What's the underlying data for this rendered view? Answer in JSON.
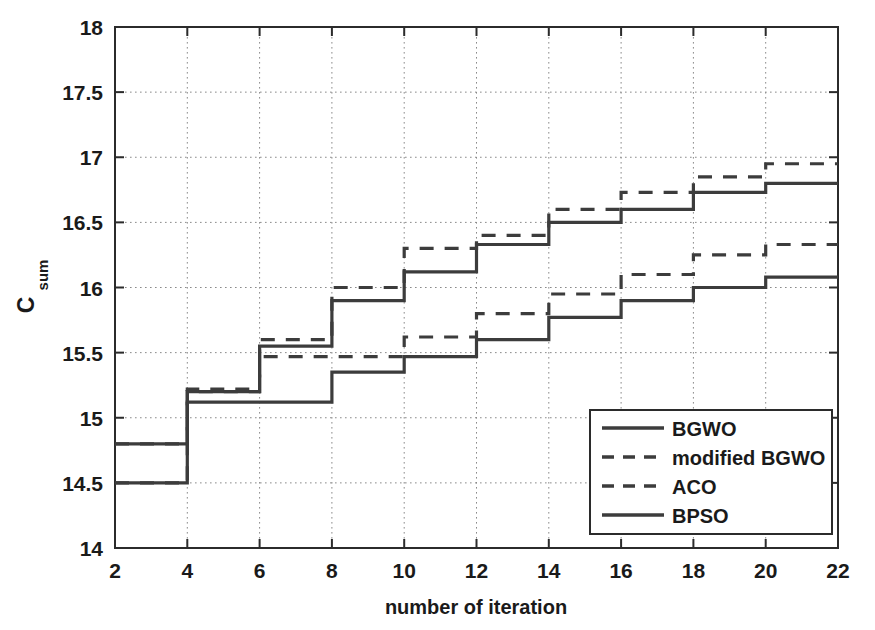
{
  "chart_data": {
    "type": "line",
    "style": "step-post",
    "title": "",
    "xlabel": "number of iteration",
    "ylabel": "C_sum",
    "ylabel_base": "C",
    "ylabel_subscript": "sum",
    "xlim": [
      2,
      22
    ],
    "ylim": [
      14,
      18
    ],
    "xticks": [
      2,
      4,
      6,
      8,
      10,
      12,
      14,
      16,
      18,
      20,
      22
    ],
    "xtick_labels": [
      "2",
      "4",
      "6",
      "8",
      "10",
      "12",
      "14",
      "16",
      "18",
      "20",
      "22"
    ],
    "yticks": [
      14,
      14.5,
      15,
      15.5,
      16,
      16.5,
      17,
      17.5,
      18
    ],
    "ytick_labels": [
      "14",
      "14.5",
      "15",
      "15.5",
      "16",
      "16.5",
      "17",
      "17.5",
      "18"
    ],
    "grid": true,
    "grid_style": "dotted",
    "legend_position": "lower right",
    "x": [
      2,
      4,
      6,
      8,
      10,
      12,
      14,
      16,
      18,
      20,
      22
    ],
    "series": [
      {
        "name": "BGWO",
        "linestyle": "solid",
        "color": "#3c3c3c",
        "values": [
          14.8,
          15.2,
          15.55,
          15.9,
          16.12,
          16.33,
          16.5,
          16.6,
          16.73,
          16.8,
          16.8
        ]
      },
      {
        "name": "modified BGWO",
        "linestyle": "dashed",
        "color": "#3c3c3c",
        "values": [
          14.8,
          15.22,
          15.6,
          16.0,
          16.3,
          16.4,
          16.6,
          16.73,
          16.85,
          16.95,
          16.95
        ]
      },
      {
        "name": "ACO",
        "linestyle": "dashed",
        "color": "#3c3c3c",
        "values": [
          14.5,
          15.2,
          15.47,
          15.47,
          15.62,
          15.8,
          15.95,
          16.1,
          16.25,
          16.33,
          16.33
        ]
      },
      {
        "name": "BPSO",
        "linestyle": "solid",
        "color": "#3c3c3c",
        "values": [
          14.5,
          15.12,
          15.12,
          15.35,
          15.47,
          15.6,
          15.77,
          15.9,
          16.0,
          16.08,
          16.08
        ]
      }
    ]
  },
  "legend": {
    "entries": [
      {
        "label": "BGWO",
        "linestyle": "solid"
      },
      {
        "label": "modified BGWO",
        "linestyle": "dashed"
      },
      {
        "label": "ACO",
        "linestyle": "dashed"
      },
      {
        "label": "BPSO",
        "linestyle": "solid"
      }
    ]
  },
  "colors": {
    "axis": "#2b2b2b",
    "grid": "#8a8a8a",
    "line": "#3c3c3c",
    "text": "#1a1a1a",
    "background": "#ffffff"
  }
}
